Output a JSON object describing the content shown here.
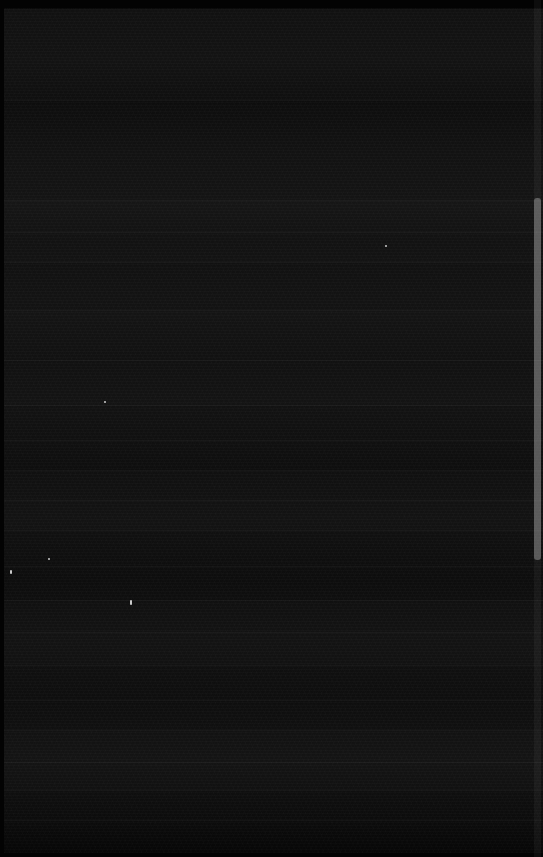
{
  "capture": {
    "state_label": "blank-dark-screen",
    "description": "Near-black screen capture with no legible interface text",
    "width": 543,
    "height": 857
  },
  "colors": {
    "background": "#0b0b0b",
    "frame": "#030303",
    "divider": "#1d1d1d",
    "scrollbar_track": "#1a1a1a",
    "scrollbar_thumb": "#4a4a4a",
    "speckle": "#ffffff"
  },
  "frame": {
    "top_band_height": 8,
    "bottom_band_height": 4,
    "left_band_width": 4
  },
  "content": {
    "dividers_y": [
      100,
      200,
      232,
      262,
      310,
      360,
      405,
      440,
      470,
      500,
      530,
      566,
      600,
      632,
      665,
      700,
      730,
      762,
      790,
      820
    ],
    "row_bands": [
      {
        "top": 9,
        "height": 91
      },
      {
        "top": 101,
        "height": 99
      },
      {
        "top": 201,
        "height": 61
      },
      {
        "top": 263,
        "height": 47
      },
      {
        "top": 311,
        "height": 94
      },
      {
        "top": 406,
        "height": 64
      },
      {
        "top": 471,
        "height": 59
      },
      {
        "top": 531,
        "height": 69
      },
      {
        "top": 601,
        "height": 64
      },
      {
        "top": 666,
        "height": 64
      },
      {
        "top": 731,
        "height": 59
      },
      {
        "top": 791,
        "height": 62
      }
    ]
  },
  "scrollbar": {
    "label": "vertical-scrollbar",
    "track_top": 0,
    "track_height": 857,
    "thumb_top": 198,
    "thumb_height": 362
  },
  "speckles": [
    {
      "x": 10,
      "y": 570,
      "w": 2,
      "h": 4
    },
    {
      "x": 48,
      "y": 558,
      "w": 2,
      "h": 2
    },
    {
      "x": 130,
      "y": 600,
      "w": 2,
      "h": 5
    },
    {
      "x": 385,
      "y": 245,
      "w": 2,
      "h": 2
    },
    {
      "x": 104,
      "y": 401,
      "w": 2,
      "h": 2
    }
  ]
}
